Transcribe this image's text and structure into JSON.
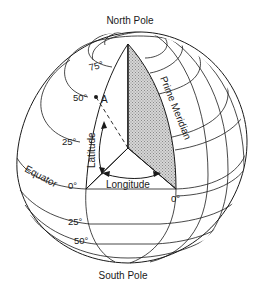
{
  "diagram": {
    "labels": {
      "north_pole": "North Pole",
      "south_pole": "South Pole",
      "prime_meridian": "Prime Meridian",
      "equator": "Equator",
      "latitude": "Latitude",
      "longitude": "Longitude",
      "point_a": "A"
    },
    "latitude_ticks": {
      "n75": "75°",
      "n50": "50°",
      "n25": "25°",
      "eq": "0°",
      "s25": "25°",
      "s50": "50°"
    },
    "longitude_ticks": {
      "prime": "0°"
    },
    "colors": {
      "line": "#1a1a1a",
      "wedge_fill": "#c8c8c8",
      "background": "#ffffff"
    }
  }
}
